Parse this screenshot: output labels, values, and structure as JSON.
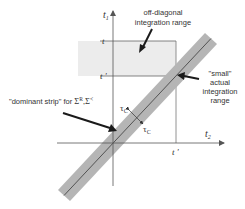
{
  "diagram": {
    "axes": {
      "vertical_label": "t",
      "vertical_sub": "1",
      "horizontal_label": "t",
      "horizontal_sub": "2"
    },
    "ticks": {
      "y_t": "t",
      "y_tprime": "t '",
      "x_tprime": "t '"
    },
    "labels": {
      "off_diagonal_line1": "off-diagonal",
      "off_diagonal_line2": "integration range",
      "small_line1": "\"small\"",
      "small_line2": "actual",
      "small_line3": "integration",
      "small_line4": "range",
      "dominant_prefix": "\"dominant strip\" for ",
      "dominant_sigma1": "Σ",
      "dominant_sup1": "R",
      "dominant_comma": ",",
      "dominant_sigma2": "Σ",
      "dominant_sup2": "<",
      "tau_upper": "τ",
      "tau_upper_sub": "C",
      "tau_lower": "τ",
      "tau_lower_sub": "C"
    },
    "colors": {
      "strip": "#b5b5b5",
      "strip_line": "#3a3a3a",
      "region_fill": "#ececec",
      "axis": "#555555",
      "arrow": "#1a1a1a"
    }
  }
}
